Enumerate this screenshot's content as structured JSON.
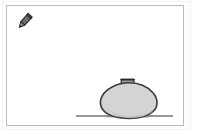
{
  "window": {
    "title": "Drawing Canvas",
    "background_color": "#ffffff",
    "outer_edge_color": "#f2f2f2"
  },
  "canvas": {
    "name": "drawing-canvas",
    "background_color": "#ffffff",
    "border_color": "#b9b9b9",
    "x": 6,
    "y": 5,
    "width": 178,
    "height": 121
  },
  "toolbar": {
    "active_tool": "pen",
    "tools": [
      {
        "icon": "pen-tool-icon",
        "label": "Pen",
        "selected": true,
        "body_color": "#6f6f6f",
        "outline_color": "#2b2b2b",
        "x": 8,
        "y": 6,
        "width": 22,
        "height": 22,
        "rotation_deg": 42
      }
    ]
  },
  "drawing": {
    "description": "Hand-drawn gray vase resting on a horizontal ground line",
    "shapes": [
      {
        "name": "vase-body",
        "type": "ellipse",
        "fill_color": "#d4d4d4",
        "stroke_color": "#3a3a3a",
        "stroke_width": 1.6,
        "center_x": 127,
        "center_y": 99,
        "radius_x": 27,
        "radius_y": 18
      },
      {
        "name": "vase-neck",
        "type": "trapezoid",
        "fill_color": "#9a9a9a",
        "stroke_color": "#3a3a3a",
        "stroke_width": 1.4,
        "x": 119,
        "y": 77,
        "width": 12,
        "height": 8
      },
      {
        "name": "vase-rim",
        "type": "line",
        "stroke_color": "#2b2b2b",
        "stroke_width": 1.6,
        "x1": 118,
        "y1": 78,
        "x2": 132,
        "y2": 78
      },
      {
        "name": "vase-shadow",
        "type": "arc",
        "fill_color": "#8d8d8d",
        "opacity": 0.55
      },
      {
        "name": "ground-line",
        "type": "line",
        "stroke_color": "#777777",
        "stroke_width": 1.4,
        "x1": 75,
        "y1": 115,
        "x2": 172,
        "y2": 115
      }
    ]
  }
}
